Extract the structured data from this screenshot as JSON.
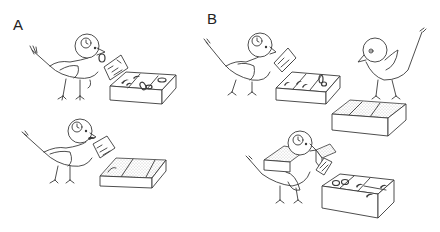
{
  "figure": {
    "panels": [
      {
        "label": "A",
        "scenes": [
          {
            "id": "A-top",
            "description": "Bird holding food card beside open tray with visible food items",
            "tray_contents": [
              "worm",
              "worm",
              "worm",
              "ring",
              "ring",
              "ring"
            ]
          },
          {
            "id": "A-bottom",
            "description": "Bird holding food card beside tray covered with sand/stipple",
            "tray_contents": [
              "covered"
            ]
          }
        ]
      },
      {
        "label": "B",
        "scenes": [
          {
            "id": "B-top-left",
            "description": "Bird holding food card beside open tray with food items",
            "tray_contents": [
              "worm",
              "worm",
              "worm",
              "ring"
            ]
          },
          {
            "id": "B-top-right",
            "description": "Observer bird without badge beside covered tray"
          },
          {
            "id": "B-bottom",
            "description": "Bird carrying covered tray and holding card beside open tray with food items",
            "tray_contents": [
              "ring",
              "ring",
              "worm",
              "worm",
              "worm"
            ]
          }
        ]
      }
    ],
    "colors": {
      "line": "#3a3a3a",
      "background": "#ffffff"
    }
  }
}
